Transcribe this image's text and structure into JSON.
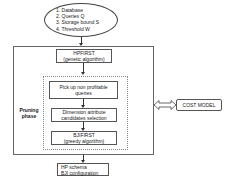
{
  "inputs": {
    "items": [
      "1. Database",
      "2. Queries Q",
      "3. Storage bound S",
      "4. Threshold W"
    ]
  },
  "hpfirst": {
    "title": "HPFIRST",
    "subtitle": "(genetic algorithm)"
  },
  "pruning_phase": {
    "label_line1": "Pruning",
    "label_line2": "phase",
    "steps": [
      {
        "line1": "Pick up non profitable",
        "line2": "queries"
      },
      {
        "line1": "Dimension attribute",
        "line2": "candidates selection"
      },
      {
        "line1": "BJIFIRST",
        "line2": "(greedy algorithm)"
      }
    ]
  },
  "cost_model": {
    "label": "COST MODEL"
  },
  "output": {
    "line1": "HP schema",
    "line2": "BJI configuration"
  }
}
